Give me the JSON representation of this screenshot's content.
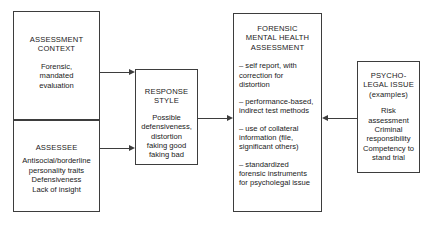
{
  "diagram": {
    "stroke_color": "#3d3d3d",
    "background_color": "#ffffff",
    "boxes": {
      "assessment_context": {
        "heading": "ASSESSMENT\nCONTEXT",
        "body": "Forensic,\nmandated\nevaluation"
      },
      "assessee": {
        "heading": "ASSESSEE",
        "body": "Antisocial/borderline\npersonality traits\nDefensiveness\nLack of insight"
      },
      "response_style": {
        "heading": "RESPONSE\nSTYLE",
        "body": "Possible\ndefensiveness,\ndistortion\nfaking good\nfaking bad"
      },
      "forensic_assessment": {
        "heading": "FORENSIC\nMENTAL HEALTH\nASSESSMENT",
        "bullets": [
          "– self report, with\ncorrection for\ndistortion",
          "– performance-based,\nindirect test methods",
          "– use of collateral\ninformation (file,\nsignificant others)",
          "– standardized\nforensic instruments\nfor psycholegal issue"
        ]
      },
      "psycholegal_issue": {
        "heading": "PSYCHO-\nLEGAL ISSUE\n(examples)",
        "body": "Risk\nassessment\nCriminal\nresponsibility\nCompetency to\nstand trial"
      }
    },
    "connectors": [
      {
        "id": "context-to-response",
        "from": "assessment_context",
        "to": "response_style",
        "direction": "right"
      },
      {
        "id": "assessee-to-response",
        "from": "assessee",
        "to": "response_style",
        "direction": "right"
      },
      {
        "id": "response-to-forensic",
        "from": "response_style",
        "to": "forensic_assessment",
        "direction": "right"
      },
      {
        "id": "psycholegal-to-forensic",
        "from": "psycholegal_issue",
        "to": "forensic_assessment",
        "direction": "left"
      }
    ]
  }
}
